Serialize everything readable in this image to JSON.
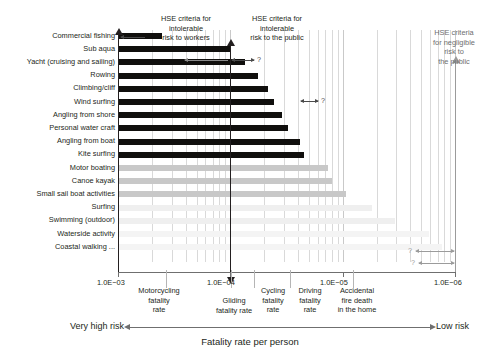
{
  "chart_data": {
    "type": "bar",
    "title": "",
    "orientation": "horizontal",
    "xlabel": "Fatality rate per person",
    "ylabel": "",
    "xscale": "log-reversed",
    "xlim": [
      0.001,
      1e-06
    ],
    "grid": true,
    "legend": null,
    "xticks": [
      {
        "label": "1.0E−03",
        "value": 0.001
      },
      {
        "label": "1.0E−04",
        "value": 0.0001
      },
      {
        "label": "1.0E−05",
        "value": 1e-05
      },
      {
        "label": "1.0E−06",
        "value": 1e-06
      }
    ],
    "categories": [
      "Commercial fishing",
      "Sub aqua",
      "Yacht (cruising and sailing)",
      "Rowing",
      "Climbing/cliff",
      "Wind surfing",
      "Angling from shore",
      "Personal water craft",
      "Angling from boat",
      "Kite surfing",
      "Motor boating",
      "Canoe kayak",
      "Small sail boat activities",
      "Surfing",
      "Swimming (outdoor)",
      "Waterside activity",
      "Coastal walking ..."
    ],
    "values": [
      0.00041,
      0.0001,
      7.4e-05,
      5.7e-05,
      4.6e-05,
      4.1e-05,
      3.5e-05,
      3.1e-05,
      2.4e-05,
      2.2e-05,
      1.35e-05,
      1.25e-05,
      9.3e-06,
      5.5e-06,
      3.4e-06,
      1.7e-06,
      1.3e-06
    ],
    "bar_shades": [
      "dark",
      "dark",
      "dark",
      "dark",
      "dark",
      "dark",
      "dark",
      "dark",
      "dark",
      "dark",
      "mid",
      "mid",
      "mid",
      "faint",
      "faint",
      "faint2",
      "faint2"
    ],
    "annotations": [
      {
        "name": "hse-intolerable-workers",
        "text": "HSE criteria for\nintolerable\nrisk to workers",
        "value": 0.001
      },
      {
        "name": "hse-intolerable-public",
        "text": "HSE criteria for\nintolerable\nrisk to the public",
        "value": 0.0001
      },
      {
        "name": "hse-negligible-public",
        "text": "HSE criteria\nfor negligible\nrisk to\nthe public",
        "value": 1e-06
      }
    ],
    "reference_lines": [
      {
        "name": "motorcycling-fatality-rate",
        "label": "Motorcycling\nfatality\nrate",
        "value": 0.000375
      },
      {
        "name": "gliding-fatality-rate",
        "label": "Gliding\nfatality rate",
        "value": 9.8e-05
      },
      {
        "name": "cycling-fatality-rate",
        "label": "Cycling\nfatality\nrate",
        "value": 6.2e-05
      },
      {
        "name": "driving-fatality-rate",
        "label": "Driving\nfatality\nrate",
        "value": 2.95e-05
      },
      {
        "name": "accidental-fire-death",
        "label": "Accidental\nfire death\nin the home",
        "value": 8.1e-06
      }
    ],
    "uncertainty_markers": [
      {
        "name": "sub-aqua-uncertainty",
        "symbol": "?",
        "row": 1
      },
      {
        "name": "climbing-uncertainty",
        "symbol": "?",
        "row": 4
      },
      {
        "name": "waterside-uncertainty",
        "symbol": "?",
        "row": 15
      },
      {
        "name": "coastal-walking-uncertainty",
        "symbol": "?",
        "row": 16
      }
    ]
  },
  "axis": {
    "tick_1": "1.0E−03",
    "tick_2": "1.0E−04",
    "tick_3": "1.0E−05",
    "tick_4": "1.0E−06",
    "title": "Fatality rate per person",
    "left_risk": "Very high risk",
    "right_risk": "Low risk"
  },
  "criteria": {
    "workers_l1": "HSE criteria for",
    "workers_l2": "intolerable",
    "workers_l3": "risk to workers",
    "public_l1": "HSE criteria for",
    "public_l2": "intolerable",
    "public_l3": "risk to the public",
    "negligible_l1": "HSE criteria",
    "negligible_l2": "for negligible",
    "negligible_l3": "risk to",
    "negligible_l4": "the public"
  },
  "refs": {
    "motorcycling_l1": "Motorcycling",
    "motorcycling_l2": "fatality",
    "motorcycling_l3": "rate",
    "gliding_l1": "Gliding",
    "gliding_l2": "fatality rate",
    "cycling_l1": "Cycling",
    "cycling_l2": "fatality",
    "cycling_l3": "rate",
    "driving_l1": "Driving",
    "driving_l2": "fatality",
    "driving_l3": "rate",
    "fire_l1": "Accidental",
    "fire_l2": "fire death",
    "fire_l3": "in the home"
  },
  "markers": {
    "q": "?"
  }
}
